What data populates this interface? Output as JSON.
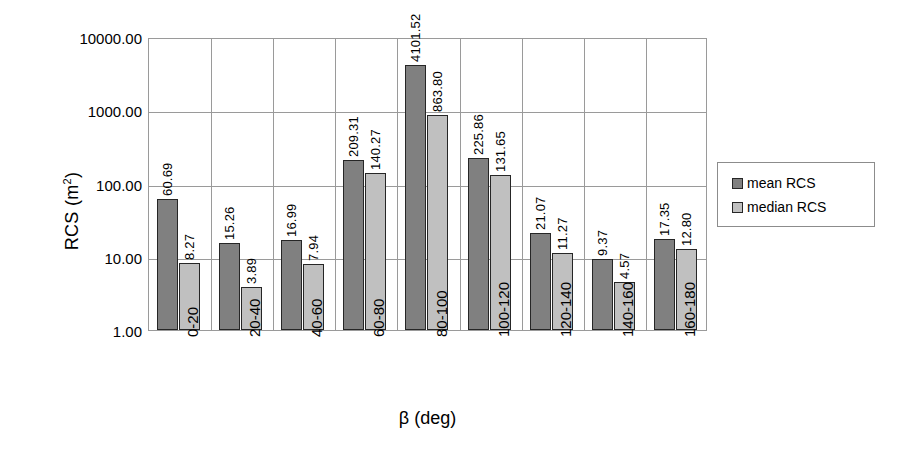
{
  "chart_data": {
    "type": "bar",
    "title": "",
    "xlabel": "β (deg)",
    "ylabel": "RCS (m²)",
    "ylabel_base": "RCS (m",
    "ylabel_sup": "2",
    "ylabel_close": ")",
    "yscale": "log",
    "ylim": [
      1,
      10000
    ],
    "grid": true,
    "legend_position": "right",
    "ytick_labels": [
      "10000.00",
      "1000.00",
      "100.00",
      "10.00",
      "1.00"
    ],
    "ytick_values": [
      10000,
      1000,
      100,
      10,
      1
    ],
    "categories": [
      "0-20",
      "20-40",
      "40-60",
      "60-80",
      "80-100",
      "100-120",
      "120-140",
      "140-160",
      "160-180"
    ],
    "series": [
      {
        "name": "mean RCS",
        "color": "#808080",
        "values": [
          60.69,
          15.26,
          16.99,
          209.31,
          4101.52,
          225.86,
          21.07,
          9.37,
          17.35
        ],
        "labels": [
          "60.69",
          "15.26",
          "16.99",
          "209.31",
          "4101.52",
          "225.86",
          "21.07",
          "9.37",
          "17.35"
        ]
      },
      {
        "name": "median RCS",
        "color": "#c0c0c0",
        "values": [
          8.27,
          3.89,
          7.94,
          140.27,
          863.8,
          131.65,
          11.27,
          4.57,
          12.8
        ],
        "labels": [
          "8.27",
          "3.89",
          "7.94",
          "140.27",
          "863.80",
          "131.65",
          "11.27",
          "4.57",
          "12.80"
        ]
      }
    ]
  },
  "legend": {
    "items": [
      {
        "label": "mean RCS"
      },
      {
        "label": "median RCS"
      }
    ]
  }
}
